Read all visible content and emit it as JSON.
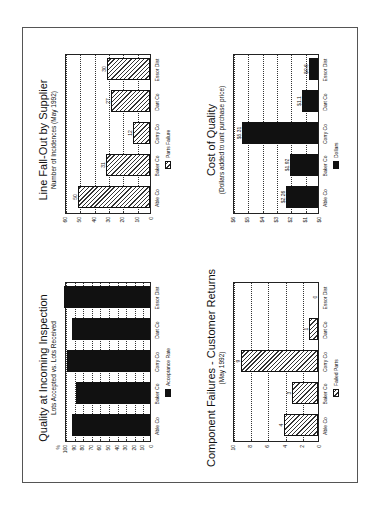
{
  "chart_data": [
    {
      "type": "bar",
      "title": "Quality at Incoming Inspection",
      "subtitle": "Lots Accepted vs. Lots Received",
      "categories": [
        "Able Co",
        "Baker Co",
        "Corry Co",
        "Dart Co",
        "Essor Dist"
      ],
      "values": [
        91,
        86,
        96,
        91,
        100
      ],
      "ylabel": "%",
      "yticks": [
        "0",
        "10",
        "20",
        "30",
        "40",
        "50",
        "60",
        "70",
        "80",
        "90",
        "100"
      ],
      "ylim": [
        0,
        100
      ],
      "legend": [
        "Acceptance Rate"
      ],
      "fill": "solid",
      "grid": true
    },
    {
      "type": "bar",
      "title": "Line Fall-Out by Supplier",
      "subtitle": "Number of Incidences (May 1992)",
      "categories": [
        "Able Co",
        "Baker Co",
        "Corry Co",
        "Dart Co",
        "Essor Dist"
      ],
      "values": [
        50,
        31,
        12,
        27,
        30
      ],
      "labels": [
        "50",
        "31",
        "12",
        "27",
        "30"
      ],
      "yticks": [
        "0",
        "10",
        "20",
        "30",
        "40",
        "50",
        "60"
      ],
      "ylim": [
        0,
        60
      ],
      "legend": [
        "Parts Failure"
      ],
      "fill": "hatch",
      "grid": true
    },
    {
      "type": "bar",
      "title": "Component Failures - Customer Returns",
      "subtitle": "(May 1992)",
      "categories": [
        "Able Co",
        "Baker Co",
        "Corry Co",
        "Dart Co",
        "Essor Dist"
      ],
      "values": [
        4,
        3,
        9,
        1,
        0
      ],
      "labels": [
        "4",
        "3",
        "9",
        "1",
        "0"
      ],
      "yticks": [
        "0",
        "2",
        "4",
        "6",
        "8",
        "10"
      ],
      "ylim": [
        0,
        10
      ],
      "legend": [
        "Failed Parts"
      ],
      "fill": "hatch",
      "grid": true
    },
    {
      "type": "bar",
      "title": "Cost of Quality",
      "subtitle": "(Dollars added to unit purchase price)",
      "categories": [
        "Able Co",
        "Baker Co",
        "Corry Co",
        "Dart Co",
        "Essor Dist"
      ],
      "values": [
        2.26,
        1.92,
        5.31,
        1.1,
        0.6
      ],
      "labels": [
        "$2.26",
        "$1.92",
        "$5.31",
        "$1.1",
        "$0.6"
      ],
      "yticks": [
        "$0",
        "$1",
        "$2",
        "$3",
        "$4",
        "$5",
        "$6"
      ],
      "ylim": [
        0,
        6
      ],
      "legend": [
        "Dollars"
      ],
      "fill": "solid",
      "grid": true
    }
  ]
}
